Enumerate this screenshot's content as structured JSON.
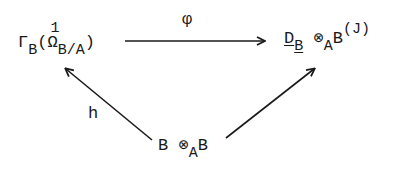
{
  "diagram": {
    "type": "commutative-triangle",
    "nodes": {
      "top_left": {
        "gamma": "Γ",
        "gamma_sub": "B",
        "open": "(",
        "omega": "Ω",
        "omega_sup": "1",
        "omega_sub": "B/A",
        "close": ")"
      },
      "top_right": {
        "d": "D",
        "d_sub": "B",
        "tensor": "⊗",
        "tensor_sub": "A",
        "b": "B",
        "arg": "(J)"
      },
      "bottom": {
        "b1": "B",
        "tensor": "⊗",
        "tensor_sub": "A",
        "b2": "B"
      }
    },
    "arrows": {
      "top": {
        "label": "φ",
        "from": "top_right_source",
        "to": "top_right"
      },
      "left": {
        "label": "h",
        "from": "bottom",
        "to": "top_left"
      },
      "right": {
        "label": "",
        "from": "bottom",
        "to": "top_right"
      }
    },
    "colors": {
      "ink": "#1a1a1a",
      "background": "#ffffff"
    }
  }
}
